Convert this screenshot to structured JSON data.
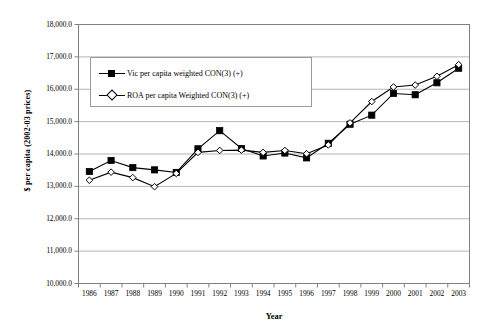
{
  "chart_data": {
    "type": "line",
    "title": "",
    "xlabel": "Year",
    "ylabel": "$ per capita (2002-03 prices)",
    "categories": [
      "1986",
      "1987",
      "1988",
      "1989",
      "1990",
      "1991",
      "1992",
      "1993",
      "1994",
      "1995",
      "1996",
      "1997",
      "1998",
      "1999",
      "2000",
      "2001",
      "2002",
      "2003"
    ],
    "ylim": [
      10000,
      18000
    ],
    "ytick_step": 1000,
    "ytick_labels": [
      "18,000.0",
      "17,000.0",
      "16,000.0",
      "15,000.0",
      "14,000.0",
      "13,000.0",
      "12,000.0",
      "11,000.0",
      "10,000.0"
    ],
    "ytick_values": [
      18000,
      17000,
      16000,
      15000,
      14000,
      13000,
      12000,
      11000,
      10000
    ],
    "grid": true,
    "grid_axis": "y",
    "legend_position": "upper-left-inside",
    "series": [
      {
        "name": "Vic per capita weighted CON(3) (+)",
        "marker": "filled-square",
        "color": "#000000",
        "values": [
          13460,
          13800,
          13580,
          13510,
          13430,
          14160,
          14720,
          14170,
          13940,
          14030,
          13880,
          14330,
          14920,
          15200,
          15870,
          15830,
          16200,
          16650
        ]
      },
      {
        "name": "ROA per capita Weighted CON(3) (+)",
        "marker": "open-diamond",
        "color": "#000000",
        "values": [
          13190,
          13440,
          13270,
          12990,
          13400,
          14050,
          14110,
          14120,
          14050,
          14110,
          14010,
          14280,
          14960,
          15620,
          16070,
          16130,
          16400,
          16760
        ]
      }
    ]
  },
  "axis": {
    "x_title": "Year",
    "y_title": "$ per capita (2002-03 prices)"
  },
  "legend": {
    "items": [
      {
        "label": "Vic per capita weighted CON(3) (+)",
        "marker": "filled-square"
      },
      {
        "label": "ROA per capita Weighted CON(3) (+)",
        "marker": "open-diamond"
      }
    ]
  }
}
